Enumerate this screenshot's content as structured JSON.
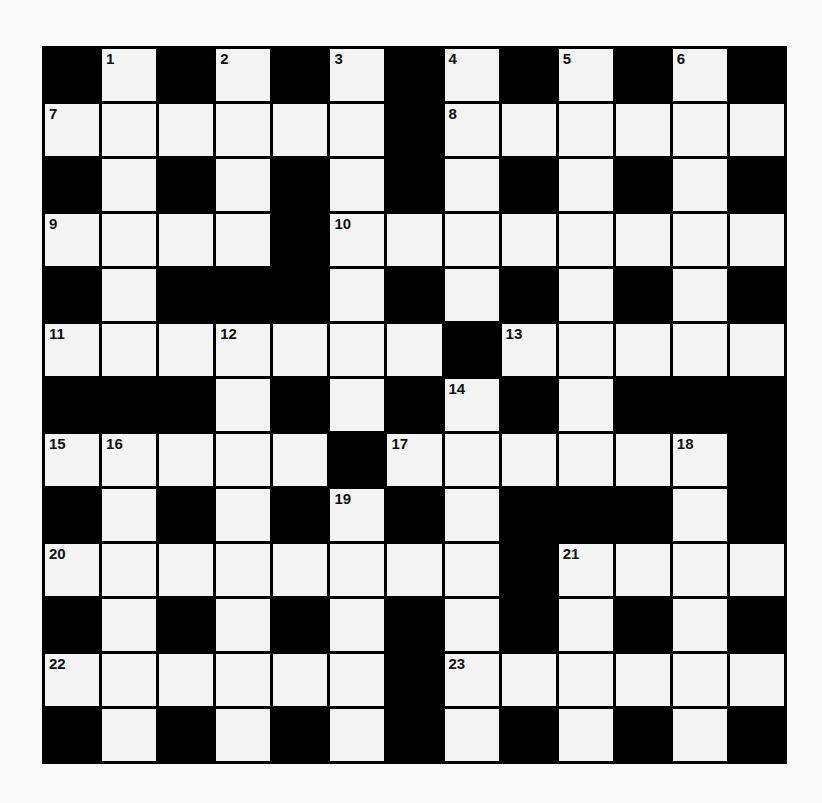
{
  "puzzle": {
    "rows": 13,
    "cols": 13,
    "grid": [
      "#.#.#.#.#.#.#",
      "......#......",
      "#.#.#.#.#.#.#",
      "....#........",
      "#.###.#.#.#.#",
      ".......#.....",
      "###.#.#.#.###",
      ".....#......#",
      "#.#.#.#.###.#",
      "........#....",
      "#.#.#.#.#.#.#",
      "......#......",
      "#.#.#.#.#.#.#"
    ],
    "numbers": [
      {
        "row": 0,
        "col": 1,
        "n": "1"
      },
      {
        "row": 0,
        "col": 3,
        "n": "2"
      },
      {
        "row": 0,
        "col": 5,
        "n": "3"
      },
      {
        "row": 0,
        "col": 7,
        "n": "4"
      },
      {
        "row": 0,
        "col": 9,
        "n": "5"
      },
      {
        "row": 0,
        "col": 11,
        "n": "6"
      },
      {
        "row": 1,
        "col": 0,
        "n": "7"
      },
      {
        "row": 1,
        "col": 7,
        "n": "8"
      },
      {
        "row": 3,
        "col": 0,
        "n": "9"
      },
      {
        "row": 3,
        "col": 5,
        "n": "10"
      },
      {
        "row": 5,
        "col": 0,
        "n": "11"
      },
      {
        "row": 5,
        "col": 3,
        "n": "12"
      },
      {
        "row": 5,
        "col": 8,
        "n": "13"
      },
      {
        "row": 6,
        "col": 7,
        "n": "14"
      },
      {
        "row": 7,
        "col": 0,
        "n": "15"
      },
      {
        "row": 7,
        "col": 1,
        "n": "16"
      },
      {
        "row": 7,
        "col": 6,
        "n": "17"
      },
      {
        "row": 7,
        "col": 11,
        "n": "18"
      },
      {
        "row": 8,
        "col": 5,
        "n": "19"
      },
      {
        "row": 9,
        "col": 0,
        "n": "20"
      },
      {
        "row": 9,
        "col": 9,
        "n": "21"
      },
      {
        "row": 11,
        "col": 0,
        "n": "22"
      },
      {
        "row": 11,
        "col": 7,
        "n": "23"
      }
    ],
    "colors": {
      "block": "#000000",
      "cell": "#f4f4f4",
      "background": "#f9f9f9"
    }
  }
}
